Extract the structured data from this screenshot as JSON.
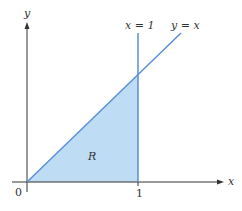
{
  "diagram": {
    "axes": {
      "x_label": "x",
      "y_label": "y",
      "origin_label": "0",
      "x_tick_label": "1"
    },
    "curves": [
      {
        "label": "x = 1",
        "type": "vertical-line"
      },
      {
        "label": "y = x",
        "type": "line"
      }
    ],
    "region": {
      "label": "R",
      "description": "triangle bounded by y = x, x = 1, and the x-axis"
    },
    "colors": {
      "axis": "#333333",
      "line": "#5b8fd6",
      "region_fill": "#bfdcf5"
    }
  }
}
